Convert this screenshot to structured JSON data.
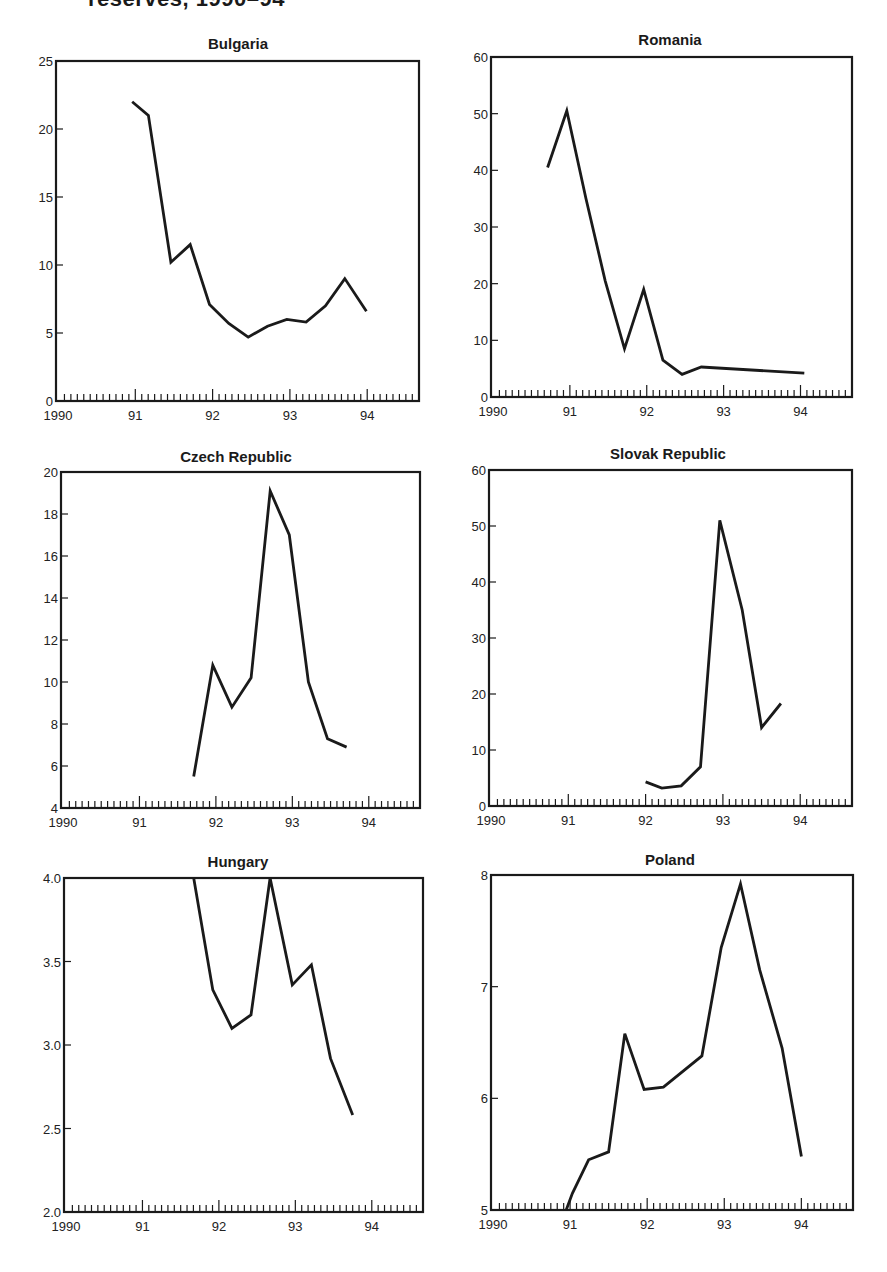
{
  "page": {
    "title": "reserves, 1990–94"
  },
  "chart_data": [
    {
      "type": "line",
      "title": "Bulgaria",
      "xlabel": "",
      "ylabel": "",
      "xlim": [
        1990,
        94.67
      ],
      "ylim": [
        0,
        25
      ],
      "yticks": [
        0,
        5,
        10,
        15,
        20,
        25
      ],
      "ytick_labels": [
        "0",
        "5",
        "10",
        "15",
        "20",
        "25"
      ],
      "xtick_labels": [
        "1990",
        "91",
        "92",
        "93",
        "94"
      ],
      "grid": false,
      "legend": null,
      "x": [
        1990.96,
        1991.17,
        1991.46,
        1991.71,
        1991.96,
        1992.21,
        1992.46,
        1992.71,
        1992.96,
        1993.21,
        1993.46,
        1993.71,
        1993.99
      ],
      "values": [
        22.0,
        21.0,
        10.2,
        11.5,
        7.1,
        5.7,
        4.7,
        5.5,
        6.0,
        5.8,
        7.0,
        9.0,
        6.6
      ],
      "box": {
        "left": 56,
        "top": 61,
        "right": 419,
        "bottom": 401
      }
    },
    {
      "type": "line",
      "title": "Romania",
      "xlabel": "",
      "ylabel": "",
      "xlim": [
        1990,
        94.67
      ],
      "ylim": [
        0,
        60
      ],
      "yticks": [
        0,
        10,
        20,
        30,
        40,
        50,
        60
      ],
      "ytick_labels": [
        "0",
        "10",
        "20",
        "30",
        "40",
        "50",
        "60"
      ],
      "xtick_labels": [
        "1990",
        "91",
        "92",
        "93",
        "94"
      ],
      "grid": false,
      "legend": null,
      "x": [
        1990.71,
        1990.96,
        1991.21,
        1991.46,
        1991.71,
        1991.96,
        1992.21,
        1992.46,
        1992.71,
        1994.05
      ],
      "values": [
        40.5,
        50.5,
        35.0,
        20.5,
        8.5,
        19.0,
        6.5,
        4.0,
        5.3,
        4.2
      ],
      "box": {
        "left": 491,
        "top": 57,
        "right": 852,
        "bottom": 397
      }
    },
    {
      "type": "line",
      "title": "Czech Republic",
      "xlabel": "",
      "ylabel": "",
      "xlim": [
        1990,
        94.67
      ],
      "ylim": [
        4,
        20
      ],
      "yticks": [
        4,
        6,
        8,
        10,
        12,
        14,
        16,
        18,
        20
      ],
      "ytick_labels": [
        "4",
        "6",
        "8",
        "10",
        "12",
        "14",
        "16",
        "18",
        "20"
      ],
      "xtick_labels": [
        "1990",
        "91",
        "92",
        "93",
        "94"
      ],
      "grid": false,
      "legend": null,
      "x": [
        1991.71,
        1991.96,
        1992.21,
        1992.46,
        1992.71,
        1992.96,
        1993.21,
        1993.46,
        1993.71
      ],
      "values": [
        5.5,
        10.8,
        8.8,
        10.2,
        19.1,
        17.0,
        10.0,
        7.3,
        6.9
      ],
      "box": {
        "left": 61,
        "top": 472,
        "right": 420,
        "bottom": 808
      }
    },
    {
      "type": "line",
      "title": "Slovak Republic",
      "xlabel": "",
      "ylabel": "",
      "xlim": [
        1990,
        94.67
      ],
      "ylim": [
        0,
        60
      ],
      "yticks": [
        0,
        10,
        20,
        30,
        40,
        50,
        60
      ],
      "ytick_labels": [
        "0",
        "10",
        "20",
        "30",
        "40",
        "50",
        "60"
      ],
      "xtick_labels": [
        "1990",
        "91",
        "92",
        "93",
        "94"
      ],
      "grid": false,
      "legend": null,
      "x": [
        1992.0,
        1992.21,
        1992.46,
        1992.71,
        1992.96,
        1993.25,
        1993.5,
        1993.75
      ],
      "values": [
        4.3,
        3.2,
        3.6,
        7.0,
        51.0,
        35.0,
        14.0,
        18.3
      ],
      "box": {
        "left": 489,
        "top": 470,
        "right": 852,
        "bottom": 806
      }
    },
    {
      "type": "line",
      "title": "Hungary",
      "xlabel": "",
      "ylabel": "",
      "xlim": [
        1990,
        94.67
      ],
      "ylim": [
        2.0,
        4.0
      ],
      "yticks": [
        2.0,
        2.5,
        3.0,
        3.5,
        4.0
      ],
      "ytick_labels": [
        "2.0",
        "2.5",
        "3.0",
        "3.5",
        "4.0"
      ],
      "xtick_labels": [
        "1990",
        "91",
        "92",
        "93",
        "94"
      ],
      "grid": false,
      "legend": null,
      "x": [
        1991.67,
        1991.92,
        1992.17,
        1992.42,
        1992.67,
        1992.96,
        1993.21,
        1993.46,
        1993.75
      ],
      "values": [
        4.0,
        3.33,
        3.1,
        3.18,
        4.0,
        3.36,
        3.48,
        2.92,
        2.58
      ],
      "box": {
        "left": 64,
        "top": 878,
        "right": 423,
        "bottom": 1212
      }
    },
    {
      "type": "line",
      "title": "Poland",
      "xlabel": "",
      "ylabel": "",
      "xlim": [
        1990,
        94.67
      ],
      "ylim": [
        5,
        8
      ],
      "yticks": [
        5,
        6,
        7,
        8
      ],
      "ytick_labels": [
        "5",
        "6",
        "7",
        "8"
      ],
      "xtick_labels": [
        "1990",
        "91",
        "92",
        "93",
        "94"
      ],
      "grid": false,
      "legend": null,
      "x": [
        1990.95,
        1991.03,
        1991.24,
        1991.5,
        1991.71,
        1991.96,
        1992.21,
        1992.71,
        1992.96,
        1993.21,
        1993.46,
        1993.75,
        1994.0
      ],
      "values": [
        5.0,
        5.15,
        5.45,
        5.52,
        6.58,
        6.08,
        6.1,
        6.38,
        7.35,
        7.92,
        7.15,
        6.45,
        5.48
      ],
      "box": {
        "left": 491,
        "top": 875,
        "right": 853,
        "bottom": 1210
      }
    }
  ],
  "style": {
    "line_color": "#1a1a1a",
    "axis_color": "#1a1a1a",
    "background": "#ffffff"
  }
}
